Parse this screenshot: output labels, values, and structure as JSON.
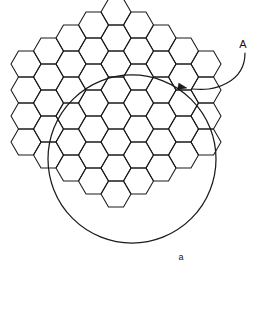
{
  "figure": {
    "canvas": {
      "width": 266,
      "height": 310,
      "background": "#ffffff"
    },
    "stroke_color": "#1a1a1a",
    "labels": {
      "cluster_label": "A",
      "cell_label": "a"
    }
  },
  "hex_grid": {
    "orientation": "flat-top-pointy-side",
    "cell_width": 30.0,
    "cell_height": 26.0,
    "column_pitch": 22.5,
    "row_pitch": 26.0,
    "origin_x": 26.0,
    "origin_y": 25.0,
    "columns": [
      {
        "index": 0,
        "rows": 4,
        "y_offset": 0.5
      },
      {
        "index": 1,
        "rows": 5,
        "y_offset": 0.0
      },
      {
        "index": 2,
        "rows": 6,
        "y_offset": -0.5
      },
      {
        "index": 3,
        "rows": 7,
        "y_offset": -1.0
      },
      {
        "index": 4,
        "rows": 8,
        "y_offset": -1.5
      },
      {
        "index": 5,
        "rows": 7,
        "y_offset": -1.0
      },
      {
        "index": 6,
        "rows": 6,
        "y_offset": -0.5
      },
      {
        "index": 7,
        "rows": 5,
        "y_offset": 0.0
      },
      {
        "index": 8,
        "rows": 4,
        "y_offset": 0.5
      }
    ]
  },
  "boundary_circle": {
    "center_x": 132.0,
    "center_y": 159.0,
    "radius": 84.0
  },
  "callout_A": {
    "label": "A",
    "label_x": 243.0,
    "label_y": 45.0,
    "path": "M 245 53 C 245 66, 240 76, 227 83 C 214 90, 203 90, 192 89",
    "arrow_tip_x": 187.0,
    "arrow_tip_y": 88.0,
    "arrow_angle_deg": 190.0
  },
  "callout_a": {
    "label": "a",
    "label_x": 181.0,
    "label_y": 258.0
  }
}
